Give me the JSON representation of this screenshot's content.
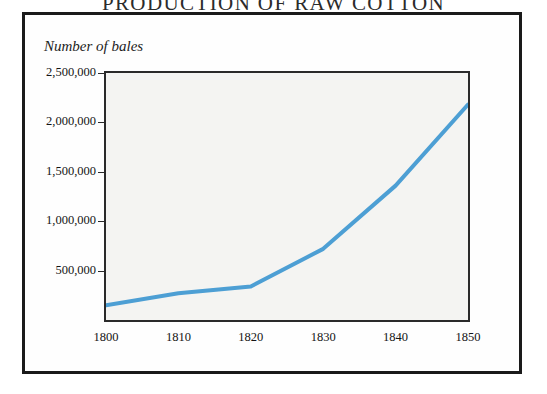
{
  "figure": {
    "title": "PRODUCTION OF RAW COTTON",
    "axis_caption": "Number of bales"
  },
  "colors": {
    "line": "#4d9fd4",
    "plot_background": "#f4f4f2",
    "frame": "#1a1a1a",
    "axis": "#2a2a2a",
    "text": "#141414"
  },
  "chart_data": {
    "type": "line",
    "title": "PRODUCTION OF RAW COTTON",
    "xlabel": "",
    "ylabel": "Number of bales",
    "x": [
      1800,
      1810,
      1820,
      1830,
      1840,
      1850
    ],
    "values": [
      150000,
      270000,
      340000,
      720000,
      1360000,
      2180000
    ],
    "series": [
      {
        "name": "Raw cotton production",
        "values": [
          150000,
          270000,
          340000,
          720000,
          1360000,
          2180000
        ]
      }
    ],
    "categories": [
      "1800",
      "1810",
      "1820",
      "1830",
      "1840",
      "1850"
    ],
    "xlim": [
      1800,
      1850
    ],
    "ylim": [
      0,
      2500000
    ],
    "x_tick_labels": [
      "1800",
      "1810",
      "1820",
      "1830",
      "1840",
      "1850"
    ],
    "y_ticks": [
      500000,
      1000000,
      1500000,
      2000000,
      2500000
    ],
    "y_tick_labels": [
      "500,000",
      "1,000,000",
      "1,500,000",
      "2,000,000",
      "2,500,000"
    ],
    "grid": false,
    "legend": "none",
    "line_color": "#4d9fd4",
    "line_width": 4
  }
}
